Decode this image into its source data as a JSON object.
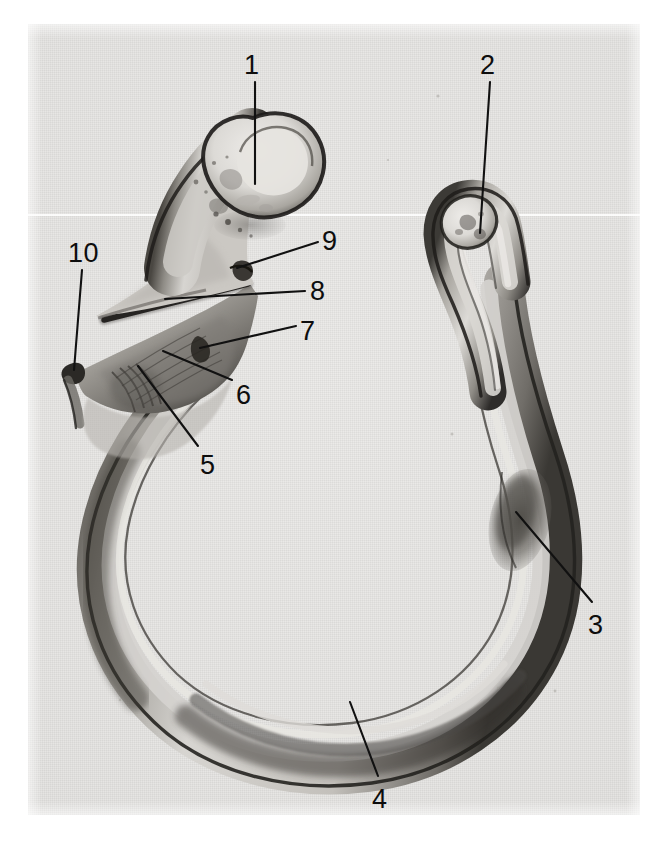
{
  "figure": {
    "kind": "anatomical-photograph",
    "medium": "black-and-white halftone photograph",
    "background_color": "#e7e6e4",
    "ink_color": "#111111",
    "plate": {
      "x": 28,
      "y": 24,
      "width": 612,
      "height": 791
    }
  },
  "callouts": [
    {
      "id": "1",
      "label": "1",
      "label_x": 244,
      "label_y": 52,
      "line": "M 255 82 L 255 184",
      "target": "bulbous proximal head (upper-left expanded end)"
    },
    {
      "id": "2",
      "label": "2",
      "label_x": 480,
      "label_y": 52,
      "line": "M 490 82 L 480 233",
      "target": "rounded distal end (upper-right tip)"
    },
    {
      "id": "3",
      "label": "3",
      "label_x": 588,
      "label_y": 612,
      "line": "M 592 602 L 516 512",
      "target": "thickened dark region on lower-right shaft"
    },
    {
      "id": "4",
      "label": "4",
      "label_x": 372,
      "label_y": 786,
      "line": "M 378 776 L 350 702",
      "target": "inferior border at the base of the arc"
    },
    {
      "id": "5",
      "label": "5",
      "label_x": 200,
      "label_y": 452,
      "line": "M 198 446 L 138 366",
      "target": "roughened tuberosity on the anterior shaft"
    },
    {
      "id": "6",
      "label": "6",
      "label_x": 236,
      "label_y": 382,
      "line": "M 232 380 L 163 351",
      "target": "broad flattened surface of the proximal shaft"
    },
    {
      "id": "7",
      "label": "7",
      "label_x": 300,
      "label_y": 318,
      "line": "M 296 326 L 200 348",
      "target": "lateral notch / margin of the flange"
    },
    {
      "id": "8",
      "label": "8",
      "label_x": 310,
      "label_y": 278,
      "line": "M 305 291 L 165 299",
      "target": "sharp crest running along the under-edge"
    },
    {
      "id": "9",
      "label": "9",
      "label_x": 322,
      "label_y": 228,
      "line": "M 318 242 L 237 268",
      "target": "small projecting tubercle at the neck"
    },
    {
      "id": "10",
      "label": "10",
      "label_x": 68,
      "label_y": 240,
      "line": "M 82 270 L 74 370",
      "target": "pointed medial process (left-most spur)"
    }
  ],
  "bone": {
    "outer_edge_color": "#2b2926",
    "body_fill_light": "#d9d7d3",
    "body_fill_mid": "#b9b6b1",
    "body_fill_dark": "#6d6a65",
    "head_highlight": "#e6e4e0",
    "paths": {
      "outer_contour": "M 258 119 C 290 112, 316 131, 320 158 C 324 184, 310 207, 288 221 C 276 250, 262 262, 251 268 L 246 276 C 256 282, 262 290, 259 297 C 241 300, 216 300, 199 305 C 196 322, 197 338, 201 350 C 204 362, 199 372, 186 376 C 176 392, 160 412, 141 432 C 118 456, 102 488, 93 522 C 84 556, 84 592, 94 628 C 107 672, 136 711, 176 738 C 220 768, 276 784, 332 784 C 392 784, 448 766, 490 734 C 528 704, 552 664, 562 620 C 572 576, 568 530, 556 486 C 546 446, 534 404, 528 362 C 522 320, 520 282, 512 252 C 505 228, 490 216, 470 214 C 452 213, 438 224, 434 240 C 431 258, 437 278, 448 296 C 460 318, 470 346, 474 376 C 479 412, 482 452, 486 490 C 490 530, 492 568, 484 604 C 474 646, 448 682, 410 706 C 370 730, 320 740, 272 734 C 224 727, 182 704, 156 668 C 130 630, 124 584, 134 540 C 144 496, 168 458, 198 428 C 214 412, 228 398, 238 384 C 246 372, 248 358, 246 344 C 244 328, 240 312, 236 300 C 230 286, 222 276, 214 270 C 206 262, 200 252, 198 240 C 196 222, 202 204, 212 186 C 222 166, 238 140, 258 119 Z",
      "ring_centerline": "M 190 360 C 150 400, 116 454, 104 516 C 92 580, 108 644, 152 692 C 196 742, 268 768, 340 762 C 412 756, 474 718, 506 662 C 538 606, 538 540, 520 476 C 502 414, 490 348, 488 292 C 487 256, 484 238, 478 228"
    }
  },
  "speckles": [
    {
      "x": 438,
      "y": 96,
      "r": 1.6
    },
    {
      "x": 452,
      "y": 434,
      "r": 1.5
    },
    {
      "x": 222,
      "y": 213,
      "r": 2.0
    },
    {
      "x": 236,
      "y": 226,
      "r": 2.4
    },
    {
      "x": 248,
      "y": 234,
      "r": 1.8
    },
    {
      "x": 196,
      "y": 181,
      "r": 2.2
    },
    {
      "x": 555,
      "y": 691,
      "r": 1.4
    },
    {
      "x": 498,
      "y": 688,
      "r": 1.2
    }
  ]
}
